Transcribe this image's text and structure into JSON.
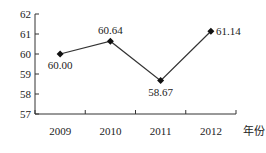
{
  "chart_data": {
    "type": "line",
    "title": "",
    "xlabel": "年份",
    "ylabel": "",
    "categories": [
      "2009",
      "2010",
      "2011",
      "2012"
    ],
    "values": [
      60.0,
      60.64,
      58.67,
      61.14
    ],
    "data_labels": [
      "60.00",
      "60.64",
      "58.67",
      "61.14"
    ],
    "ylim": [
      57,
      62
    ],
    "yticks": [
      "57",
      "58",
      "59",
      "60",
      "61",
      "62"
    ],
    "grid": false,
    "legend": null,
    "marker": "diamond",
    "line_color": "#222222"
  }
}
